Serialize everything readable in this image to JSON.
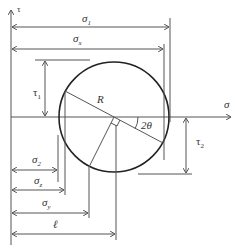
{
  "diagram": {
    "axes": {
      "horizontal": {
        "label": "σ"
      },
      "vertical": {
        "label": "τ"
      }
    },
    "circle": {
      "center": [
        114,
        117
      ],
      "radius": 55
    },
    "labels": {
      "sigma1": {
        "base": "σ",
        "sub": "1"
      },
      "sigmax": {
        "base": "σ",
        "sub": "x"
      },
      "tau1": {
        "base": "τ",
        "sub": "1"
      },
      "tau2": {
        "base": "τ",
        "sub": "2"
      },
      "radius": "R",
      "angle": "2θ",
      "sigma2": {
        "base": "σ",
        "sub": "2"
      },
      "sigmaz": {
        "base": "σ",
        "sub": "z"
      },
      "sigmay": {
        "base": "σ",
        "sub": "y"
      },
      "ell": "ℓ"
    },
    "dimensions": [
      {
        "name": "sigma1",
        "y": 27,
        "x_end": 170
      },
      {
        "name": "sigmax",
        "y": 49,
        "x_end": 164
      },
      {
        "name": "sigma2",
        "y": 170,
        "x_end": 58
      },
      {
        "name": "sigmaz",
        "y": 190,
        "x_end": 65
      },
      {
        "name": "sigmay",
        "y": 213,
        "x_end": 89
      },
      {
        "name": "ell",
        "y": 234,
        "x_end": 116
      }
    ]
  }
}
